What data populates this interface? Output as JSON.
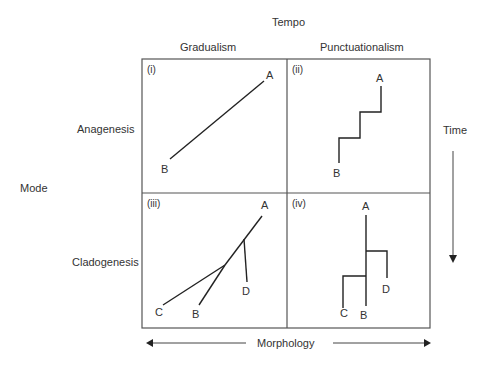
{
  "header": {
    "tempo": "Tempo",
    "gradualism": "Gradualism",
    "punctuationalism": "Punctuationalism"
  },
  "side": {
    "mode": "Mode",
    "anagenesis": "Anagenesis",
    "cladogenesis": "Cladogenesis"
  },
  "axes": {
    "time": "Time",
    "morphology": "Morphology"
  },
  "panels": [
    {
      "id": "(i)",
      "labels": [
        "A",
        "B"
      ]
    },
    {
      "id": "(ii)",
      "labels": [
        "A",
        "B"
      ]
    },
    {
      "id": "(iii)",
      "labels": [
        "A",
        "B",
        "C",
        "D"
      ]
    },
    {
      "id": "(iv)",
      "labels": [
        "A",
        "B",
        "C",
        "D"
      ]
    }
  ],
  "colors": {
    "line": "#222222",
    "border": "#555555",
    "text": "#333333"
  }
}
